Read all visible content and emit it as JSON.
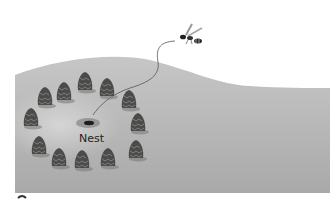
{
  "figure": {
    "nest_label": "Nest",
    "ground_color": "#b9b9b9",
    "cone_color": "#4a4a48",
    "cone_count": 12,
    "cones": [
      {
        "x": 45,
        "y": 97
      },
      {
        "x": 64,
        "y": 92
      },
      {
        "x": 85,
        "y": 82
      },
      {
        "x": 107,
        "y": 88
      },
      {
        "x": 129,
        "y": 100
      },
      {
        "x": 138,
        "y": 123
      },
      {
        "x": 136,
        "y": 150
      },
      {
        "x": 108,
        "y": 158
      },
      {
        "x": 82,
        "y": 160
      },
      {
        "x": 59,
        "y": 158
      },
      {
        "x": 39,
        "y": 146
      },
      {
        "x": 31,
        "y": 118
      }
    ]
  }
}
